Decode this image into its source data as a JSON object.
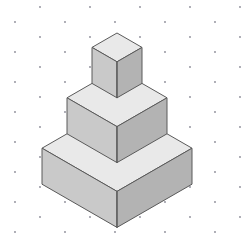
{
  "figure": {
    "canvas": {
      "width": 244,
      "height": 247,
      "background": "#ffffff"
    },
    "grid": {
      "name": "isometric-dot-grid",
      "dot_color": "#8a8a96",
      "dot_radius": 0.9,
      "column_spacing_px": 25,
      "row_spacing_px": 30,
      "column_offset_px": 15,
      "origin_x": 15,
      "origin_y": 7,
      "columns": 10,
      "rows": 9
    },
    "palette": {
      "top_face": "#e9e9e9",
      "left_face": "#c9c9c9",
      "right_face": "#b3b3b3",
      "edge": "#5a5a5a",
      "background": "#ffffff"
    },
    "projection": {
      "type": "isometric",
      "apex_x": 117,
      "apex_y": 33,
      "half_width_unit_px": 25,
      "top_half_height_unit_px": 14.4,
      "tier_height_px": 36
    },
    "tiers": [
      {
        "name": "top-tier",
        "index": 1,
        "units_half_width": 1,
        "top_apex_y": 33,
        "height_px": 36,
        "label": "Top cube"
      },
      {
        "name": "middle-tier",
        "index": 2,
        "units_half_width": 2,
        "top_apex_y": 69,
        "height_px": 36,
        "label": "Middle step"
      },
      {
        "name": "base-tier",
        "index": 3,
        "units_half_width": 3,
        "top_apex_y": 105,
        "height_px": 36,
        "label": "Base step"
      }
    ]
  },
  "chart_data": {
    "type": "diagram",
    "categories": [
      "Base step",
      "Middle step",
      "Top cube"
    ],
    "values": [
      3,
      2,
      1
    ],
    "value_label": "Half-width in grid units",
    "xlabel": "Tier",
    "ylabel": "Half-width (units)"
  }
}
